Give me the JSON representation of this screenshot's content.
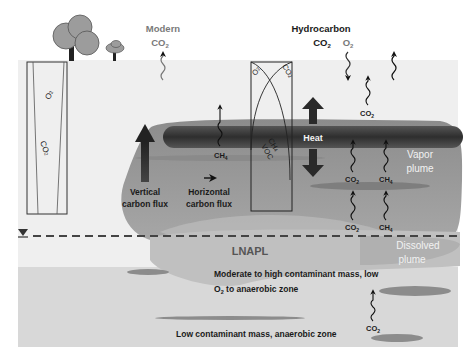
{
  "title_labels": {
    "modern_line1": "Modern",
    "modern_line2": "CO",
    "modern_sub": "2",
    "hydrocarbon_line1": "Hydrocarbon",
    "hydrocarbon_line2": "CO",
    "hydrocarbon_sub": "2",
    "o2_top": "O",
    "o2_top_sub": "2"
  },
  "zones": {
    "heat": "Heat",
    "vapor_plume_line1": "Vapor",
    "vapor_plume_line2": "plume",
    "lnapl": "LNAPL",
    "dissolved_line1": "Dissolved",
    "dissolved_line2": "plume",
    "moderate_line1": "Moderate to high contaminant mass, low",
    "moderate_line2_a": "O",
    "moderate_line2_sub": "2",
    "moderate_line2_b": " to anaerobic zone",
    "low_zone": "Low contaminant mass, anaerobic zone"
  },
  "flux": {
    "vertical_line1": "Vertical",
    "vertical_line2": "carbon flux",
    "horizontal_line1": "Horizontal",
    "horizontal_line2": "carbon flux"
  },
  "gas_labels": {
    "co2": "CO",
    "ch4": "CH",
    "co2_sub": "2",
    "ch4_sub": "4"
  },
  "left_well": {
    "o2": "O",
    "o2_sub": "2",
    "co2": "CO",
    "co2_sub": "2"
  },
  "center_well": {
    "o2": "O",
    "o2_sub": "2",
    "co2": "CO",
    "co2_sub": "2",
    "ch4": "CH",
    "ch4_sub": "4",
    "voc": "VOC"
  },
  "colors": {
    "background": "#ffffff",
    "vadose": "#eeeeee",
    "saturated": "#d9d9d9",
    "vapor_plume": "#9a9a9a",
    "heat_band": "#3d3d3d",
    "lnapl": "#bdbdbd",
    "text_dark": "#1a1a1a",
    "text_grey": "#7a7a7a"
  }
}
